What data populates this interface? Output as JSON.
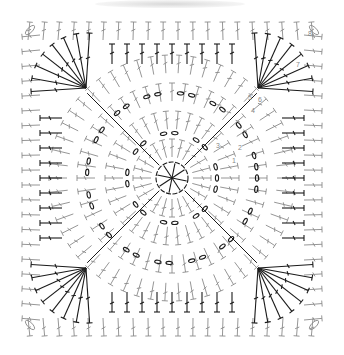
{
  "diagram": {
    "type": "crochet-granny-square-chart",
    "round_labels": [
      "1",
      "2",
      "3",
      "4",
      "5",
      "6",
      "7",
      "8"
    ],
    "colors": {
      "dark_stitch": "#1a1a1a",
      "light_stitch": "#8a8a8a",
      "label": "#888888",
      "background": "#ffffff"
    },
    "rounds": 8,
    "corners": [
      "top-left",
      "top-right",
      "bottom-left",
      "bottom-right"
    ],
    "center": {
      "type": "chain-ring",
      "spokes": 8
    }
  }
}
